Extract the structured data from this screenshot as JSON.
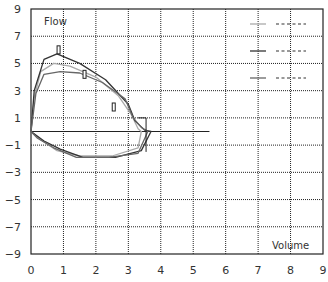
{
  "chart_data": {
    "type": "line",
    "title": "",
    "xlabel": "Volume",
    "ylabel": "Flow",
    "xlim": [
      0,
      9
    ],
    "ylim": [
      -9,
      9
    ],
    "x_ticks": [
      "0",
      "1",
      "2",
      "3",
      "4",
      "5",
      "6",
      "7",
      "8",
      "9"
    ],
    "y_ticks": [
      "9",
      "7",
      "5",
      "3",
      "1",
      "−1",
      "−3",
      "−5",
      "−7",
      "−9"
    ],
    "grid": true,
    "legend_position": "top-right",
    "legend": [
      {
        "name": "",
        "color": "#aaaaaa"
      },
      {
        "name": "",
        "color": "#333333"
      },
      {
        "name": "",
        "color": "#666666"
      }
    ],
    "series": [
      {
        "name": "loop-1",
        "color": "#aaaaaa",
        "points": [
          [
            0,
            0
          ],
          [
            0.1,
            2.5
          ],
          [
            0.3,
            4.4
          ],
          [
            0.7,
            5.0
          ],
          [
            1.2,
            4.8
          ],
          [
            2.0,
            4.0
          ],
          [
            2.7,
            2.6
          ],
          [
            3.1,
            1.2
          ],
          [
            3.3,
            0.2
          ],
          [
            3.4,
            0
          ],
          [
            3.3,
            -1.2
          ],
          [
            2.5,
            -1.8
          ],
          [
            1.5,
            -1.8
          ],
          [
            0.8,
            -1.4
          ],
          [
            0.3,
            -0.6
          ],
          [
            0,
            0
          ]
        ]
      },
      {
        "name": "loop-2",
        "color": "#333333",
        "points": [
          [
            0,
            0
          ],
          [
            0.1,
            3.0
          ],
          [
            0.4,
            5.3
          ],
          [
            0.8,
            5.7
          ],
          [
            1.5,
            5.0
          ],
          [
            2.3,
            3.8
          ],
          [
            3.0,
            2.0
          ],
          [
            3.2,
            0.8
          ],
          [
            3.5,
            0.1
          ],
          [
            3.7,
            0
          ],
          [
            3.4,
            -1.4
          ],
          [
            2.6,
            -1.9
          ],
          [
            1.6,
            -1.9
          ],
          [
            0.9,
            -1.3
          ],
          [
            0.4,
            -0.7
          ],
          [
            0,
            0
          ]
        ]
      },
      {
        "name": "loop-3",
        "color": "#666666",
        "points": [
          [
            0,
            0
          ],
          [
            0.15,
            2.8
          ],
          [
            0.4,
            4.2
          ],
          [
            0.9,
            4.4
          ],
          [
            1.5,
            4.3
          ],
          [
            2.2,
            3.6
          ],
          [
            2.9,
            2.4
          ],
          [
            3.15,
            1.0
          ],
          [
            3.4,
            0.3
          ],
          [
            3.6,
            0
          ],
          [
            3.3,
            -1.6
          ],
          [
            2.4,
            -1.9
          ],
          [
            1.4,
            -1.9
          ],
          [
            0.7,
            -1.2
          ],
          [
            0.2,
            -0.5
          ],
          [
            0,
            0
          ]
        ]
      }
    ],
    "annotations": [
      {
        "type": "marker-rect",
        "x": 0.85,
        "y": 6.0
      },
      {
        "type": "marker-rect",
        "x": 1.65,
        "y": 4.2
      },
      {
        "type": "marker-rect",
        "x": 2.55,
        "y": 1.8
      },
      {
        "type": "bracket",
        "x": 3.3,
        "y_range": [
          -1.5,
          1.0
        ]
      }
    ],
    "baseline_y": 0,
    "baseline_x_end": 5.5
  }
}
